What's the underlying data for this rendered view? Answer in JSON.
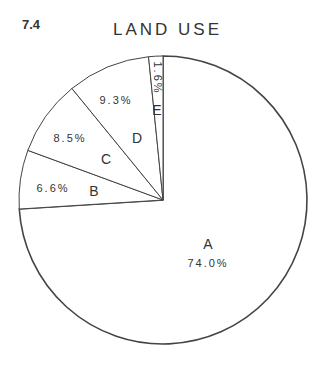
{
  "figure_number": "7.4",
  "chart_data": {
    "type": "pie",
    "title": "LAND USE",
    "categories": [
      "A",
      "B",
      "C",
      "D",
      "E"
    ],
    "values": [
      74.0,
      6.6,
      8.5,
      9.3,
      1.6
    ],
    "labels": [
      "74.0%",
      "6.6%",
      "8.5%",
      "9.3%",
      "1.6%"
    ],
    "start_angle": "12 o'clock",
    "direction": "clockwise",
    "colors": {
      "fill": "#ffffff",
      "stroke": "#444444"
    },
    "legend": "none (labels inside slices)"
  }
}
